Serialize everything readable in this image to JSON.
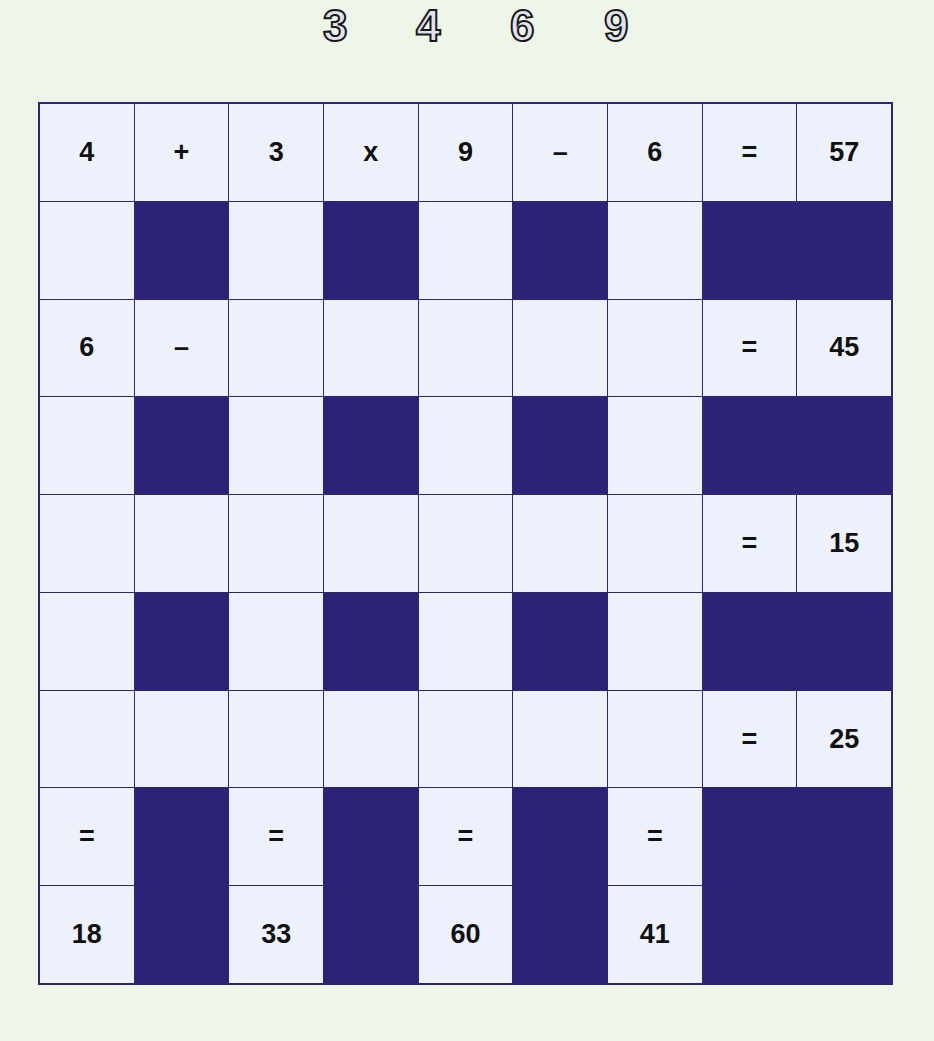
{
  "puzzle": {
    "available_digits": [
      "3",
      "4",
      "6",
      "9"
    ],
    "colors": {
      "background": "#eef6e9",
      "cell_light": "#edf1fb",
      "cell_dark": "#2a2378",
      "grid_line": "#2b2870",
      "text": "#111111"
    },
    "rows": [
      {
        "cells": [
          "4",
          "+",
          "3",
          "x",
          "9",
          "–",
          "6",
          "=",
          "57"
        ]
      },
      {
        "cells": [
          "",
          "#",
          "",
          "#",
          "",
          "#",
          "",
          "##"
        ]
      },
      {
        "cells": [
          "6",
          "–",
          "",
          "",
          "",
          "",
          "",
          "=",
          "45"
        ]
      },
      {
        "cells": [
          "",
          "#",
          "",
          "#",
          "",
          "#",
          "",
          "##"
        ]
      },
      {
        "cells": [
          "",
          "",
          "",
          "",
          "",
          "",
          "",
          "=",
          "15"
        ]
      },
      {
        "cells": [
          "",
          "#",
          "",
          "#",
          "",
          "#",
          "",
          "##"
        ]
      },
      {
        "cells": [
          "",
          "",
          "",
          "",
          "",
          "",
          "",
          "=",
          "25"
        ]
      },
      {
        "cells": [
          "=",
          "#",
          "=",
          "#",
          "=",
          "#",
          "=",
          "##"
        ]
      },
      {
        "cells": [
          "18",
          "#",
          "33",
          "#",
          "60",
          "#",
          "41",
          "##"
        ]
      }
    ],
    "row_results": [
      "57",
      "45",
      "15",
      "25"
    ],
    "column_results": [
      "18",
      "33",
      "60",
      "41"
    ]
  }
}
